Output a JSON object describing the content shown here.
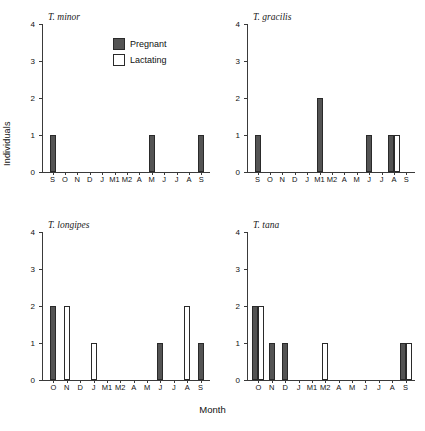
{
  "figure": {
    "ylabel": "Individuals",
    "xlabel": "Month"
  },
  "legend": {
    "position": "top-center",
    "items": [
      {
        "label": "Pregnant",
        "color": "#545454",
        "style": "filled"
      },
      {
        "label": "Lactating",
        "color": "#ffffff",
        "style": "outline"
      }
    ]
  },
  "chart_data": [
    {
      "type": "bar",
      "title": "T. minor",
      "panel": "top-left",
      "xlabel": "Month",
      "ylabel": "Individuals",
      "ylim": [
        0,
        4
      ],
      "yticks": [
        0,
        1,
        2,
        3,
        4
      ],
      "grid": false,
      "categories": [
        "S",
        "O",
        "N",
        "D",
        "J",
        "M1",
        "M2",
        "A",
        "M",
        "J",
        "J",
        "A",
        "S"
      ],
      "series": [
        {
          "name": "Pregnant",
          "color": "#545454",
          "values": [
            1,
            0,
            0,
            0,
            0,
            0,
            0,
            0,
            1,
            0,
            0,
            0,
            1
          ]
        },
        {
          "name": "Lactating",
          "color": "#ffffff",
          "values": [
            0,
            0,
            0,
            0,
            0,
            0,
            0,
            0,
            0,
            0,
            0,
            0,
            0
          ]
        }
      ]
    },
    {
      "type": "bar",
      "title": "T. gracilis",
      "panel": "top-right",
      "xlabel": "Month",
      "ylabel": "Individuals",
      "ylim": [
        0,
        4
      ],
      "yticks": [
        0,
        1,
        2,
        3,
        4
      ],
      "grid": false,
      "categories": [
        "S",
        "O",
        "N",
        "D",
        "J",
        "M1",
        "M2",
        "A",
        "M",
        "J",
        "J",
        "A",
        "S"
      ],
      "series": [
        {
          "name": "Pregnant",
          "color": "#545454",
          "values": [
            1,
            0,
            0,
            0,
            0,
            2,
            0,
            0,
            0,
            1,
            0,
            1,
            0
          ]
        },
        {
          "name": "Lactating",
          "color": "#ffffff",
          "values": [
            0,
            0,
            0,
            0,
            0,
            0,
            0,
            0,
            0,
            0,
            0,
            1,
            0
          ]
        }
      ]
    },
    {
      "type": "bar",
      "title": "T. longipes",
      "panel": "bottom-left",
      "xlabel": "Month",
      "ylabel": "Individuals",
      "ylim": [
        0,
        4
      ],
      "yticks": [
        0,
        1,
        2,
        3,
        4
      ],
      "grid": false,
      "categories": [
        "O",
        "N",
        "D",
        "J",
        "M1",
        "M2",
        "A",
        "M",
        "J",
        "J",
        "A",
        "S"
      ],
      "series": [
        {
          "name": "Pregnant",
          "color": "#545454",
          "values": [
            2,
            0,
            0,
            0,
            0,
            0,
            0,
            0,
            1,
            0,
            0,
            1
          ]
        },
        {
          "name": "Lactating",
          "color": "#ffffff",
          "values": [
            0,
            2,
            0,
            1,
            0,
            0,
            0,
            0,
            0,
            0,
            2,
            0
          ]
        }
      ]
    },
    {
      "type": "bar",
      "title": "T. tana",
      "panel": "bottom-right",
      "xlabel": "Month",
      "ylabel": "Individuals",
      "ylim": [
        0,
        4
      ],
      "yticks": [
        0,
        1,
        2,
        3,
        4
      ],
      "grid": false,
      "categories": [
        "O",
        "N",
        "D",
        "J",
        "M1",
        "M2",
        "A",
        "M",
        "J",
        "J",
        "A",
        "S"
      ],
      "series": [
        {
          "name": "Pregnant",
          "color": "#545454",
          "values": [
            2,
            1,
            1,
            0,
            0,
            0,
            0,
            0,
            0,
            0,
            0,
            1
          ]
        },
        {
          "name": "Lactating",
          "color": "#ffffff",
          "values": [
            2,
            0,
            0,
            0,
            0,
            1,
            0,
            0,
            0,
            0,
            0,
            1
          ]
        }
      ]
    }
  ]
}
